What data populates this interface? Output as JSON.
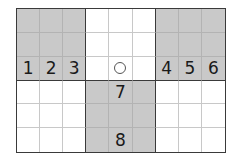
{
  "diagram": {
    "rows": 6,
    "cols": 9,
    "shaded_blocks": [
      {
        "rows": [
          1,
          3
        ],
        "cols": [
          1,
          3
        ]
      },
      {
        "rows": [
          1,
          3
        ],
        "cols": [
          7,
          9
        ]
      },
      {
        "rows": [
          4,
          6
        ],
        "cols": [
          4,
          6
        ]
      }
    ],
    "labels": [
      {
        "row": 3,
        "col": 1,
        "text": "1"
      },
      {
        "row": 3,
        "col": 2,
        "text": "2"
      },
      {
        "row": 3,
        "col": 3,
        "text": "3"
      },
      {
        "row": 3,
        "col": 7,
        "text": "4"
      },
      {
        "row": 3,
        "col": 8,
        "text": "5"
      },
      {
        "row": 3,
        "col": 9,
        "text": "6"
      },
      {
        "row": 4,
        "col": 5,
        "text": "7"
      },
      {
        "row": 6,
        "col": 5,
        "text": "8"
      }
    ],
    "markers": [
      {
        "row": 3,
        "col": 5,
        "type": "circle"
      }
    ],
    "colors": {
      "shade": "#c9c9c9",
      "thick_line": "#3a3a3a",
      "thin_line": "#c8c8c8"
    }
  }
}
